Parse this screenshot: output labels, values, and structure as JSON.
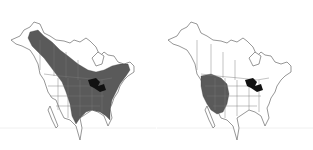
{
  "figure": {
    "type": "range-map-comparison",
    "region": "North America",
    "panels": [
      {
        "id": "left",
        "name": "range-map-broad",
        "range_description": "Broad range from Alaska southeast across boreal Canada, the Great Lakes and the entire eastern United States to the Gulf Coast and Florida",
        "range_color": "#5a5a5a",
        "lakes_color": "#111111",
        "label": ""
      },
      {
        "id": "right",
        "name": "range-map-western",
        "range_description": "Restricted range in the western interior United States (Great Basin / intermountain West)",
        "range_color": "#5a5a5a",
        "lakes_color": "#111111",
        "label": ""
      }
    ],
    "base_color": "#ffffff",
    "line_color": "#6a6a6a"
  }
}
